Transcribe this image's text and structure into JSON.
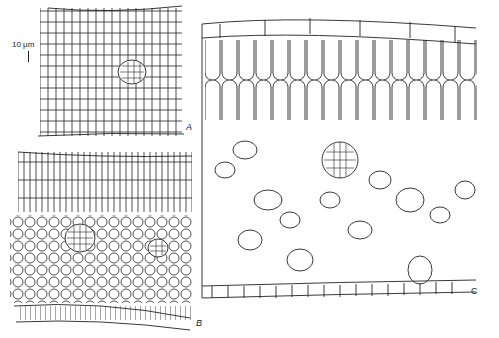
{
  "figure": {
    "panels": [
      {
        "id": "A",
        "label": "A",
        "description": "Transverse section, compact tissue with central vascular bundle"
      },
      {
        "id": "B",
        "label": "B",
        "description": "Transverse section, palisade layers above spongy rounded cells with two vascular bundles"
      },
      {
        "id": "C",
        "label": "C",
        "description": "Enlarged transverse section, elongated palisade cells, vascular bundle, large air spaces, lower epidermis"
      }
    ],
    "scale_bar": {
      "label": "10 µm"
    }
  }
}
